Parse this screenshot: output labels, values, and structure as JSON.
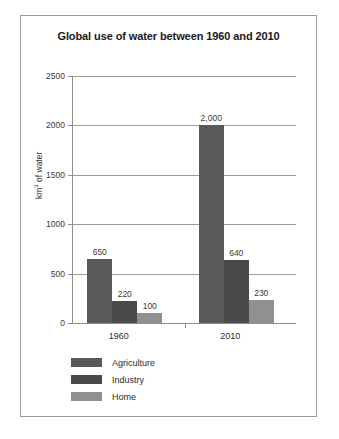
{
  "chart_data": {
    "type": "bar",
    "title": "Global use of water between 1960 and 2010",
    "xlabel": "",
    "ylabel": "km3 of water",
    "ylabel_parts": {
      "prefix": "km",
      "sup": "3",
      "suffix": " of water"
    },
    "categories": [
      "1960",
      "2010"
    ],
    "series": [
      {
        "name": "Agriculture",
        "color": "#595959",
        "values": [
          650,
          2000
        ],
        "labels": [
          "650",
          "2,000"
        ]
      },
      {
        "name": "Industry",
        "color": "#4a4a4a",
        "values": [
          220,
          640
        ],
        "labels": [
          "220",
          "640"
        ]
      },
      {
        "name": "Home",
        "color": "#909090",
        "values": [
          100,
          230
        ],
        "labels": [
          "100",
          "230"
        ]
      }
    ],
    "ylim": [
      0,
      2500
    ],
    "ytick_values": [
      0,
      500,
      1000,
      1500,
      2000,
      2500
    ],
    "ytick_labels": [
      "0",
      "500",
      "1000",
      "1500",
      "2000",
      "2500"
    ],
    "grid": "horizontal",
    "legend_position": "bottom-left"
  },
  "frame": {
    "border_color": "#9a9a9a",
    "background": "#ffffff"
  }
}
